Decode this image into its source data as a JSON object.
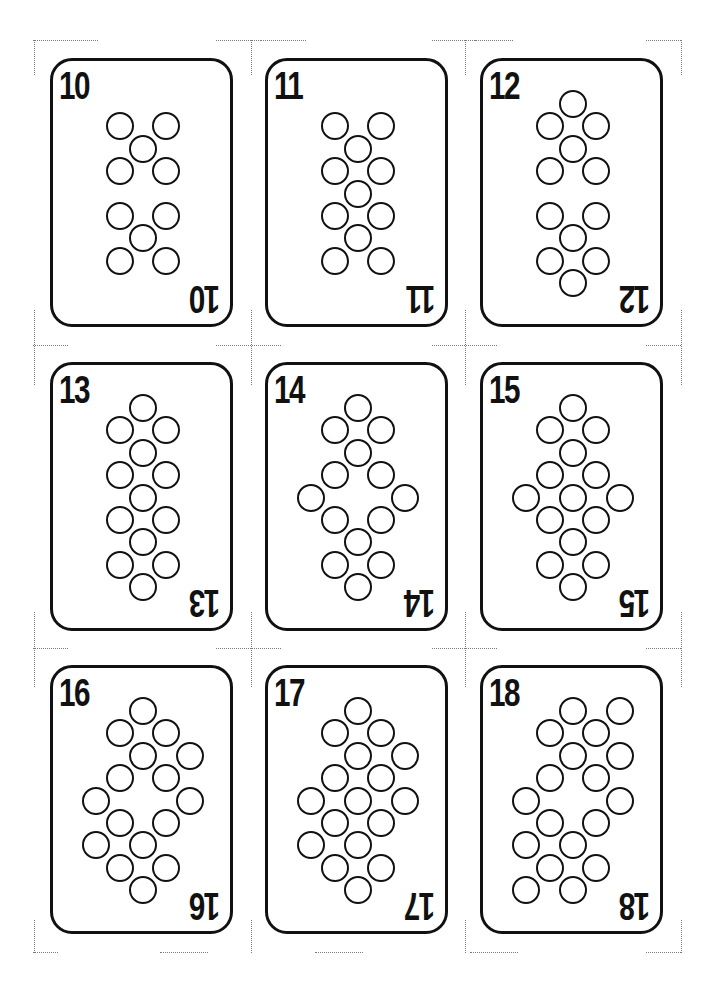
{
  "sheet": {
    "title": "Number cards 10-18 print sheet",
    "card_size": {
      "w": 183,
      "h": 269
    },
    "lattice": {
      "center_x": 93,
      "col_step": 23.3,
      "top_y": 46,
      "row_step": 22.4,
      "pip_diameter": 28
    },
    "colors": {
      "ink": "#111111",
      "paper": "#ffffff",
      "crop_marks": "#7a7a7a"
    }
  },
  "cards": [
    {
      "rank": "10",
      "x": 50,
      "y": 58,
      "pips": [
        [
          -1,
          1
        ],
        [
          1,
          1
        ],
        [
          0,
          2
        ],
        [
          -1,
          3
        ],
        [
          1,
          3
        ],
        [
          -1,
          5
        ],
        [
          1,
          5
        ],
        [
          0,
          6
        ],
        [
          -1,
          7
        ],
        [
          1,
          7
        ]
      ]
    },
    {
      "rank": "11",
      "x": 265,
      "y": 58,
      "pips": [
        [
          -1,
          1
        ],
        [
          1,
          1
        ],
        [
          0,
          2
        ],
        [
          -1,
          3
        ],
        [
          1,
          3
        ],
        [
          0,
          4
        ],
        [
          -1,
          5
        ],
        [
          1,
          5
        ],
        [
          0,
          6
        ],
        [
          -1,
          7
        ],
        [
          1,
          7
        ]
      ]
    },
    {
      "rank": "12",
      "x": 480,
      "y": 58,
      "pips": [
        [
          0,
          0
        ],
        [
          -1,
          1
        ],
        [
          1,
          1
        ],
        [
          0,
          2
        ],
        [
          -1,
          3
        ],
        [
          1,
          3
        ],
        [
          -1,
          5
        ],
        [
          1,
          5
        ],
        [
          0,
          6
        ],
        [
          -1,
          7
        ],
        [
          1,
          7
        ],
        [
          0,
          8
        ]
      ]
    },
    {
      "rank": "13",
      "x": 50,
      "y": 362,
      "pips": [
        [
          0,
          0
        ],
        [
          -1,
          1
        ],
        [
          1,
          1
        ],
        [
          0,
          2
        ],
        [
          -1,
          3
        ],
        [
          1,
          3
        ],
        [
          0,
          4
        ],
        [
          -1,
          5
        ],
        [
          1,
          5
        ],
        [
          0,
          6
        ],
        [
          -1,
          7
        ],
        [
          1,
          7
        ],
        [
          0,
          8
        ]
      ]
    },
    {
      "rank": "14",
      "x": 265,
      "y": 362,
      "pips": [
        [
          0,
          0
        ],
        [
          -1,
          1
        ],
        [
          1,
          1
        ],
        [
          0,
          2
        ],
        [
          -1,
          3
        ],
        [
          1,
          3
        ],
        [
          -2,
          4
        ],
        [
          2,
          4
        ],
        [
          -1,
          5
        ],
        [
          1,
          5
        ],
        [
          0,
          6
        ],
        [
          -1,
          7
        ],
        [
          1,
          7
        ],
        [
          0,
          8
        ]
      ]
    },
    {
      "rank": "15",
      "x": 480,
      "y": 362,
      "pips": [
        [
          0,
          0
        ],
        [
          -1,
          1
        ],
        [
          1,
          1
        ],
        [
          0,
          2
        ],
        [
          -1,
          3
        ],
        [
          1,
          3
        ],
        [
          -2,
          4
        ],
        [
          0,
          4
        ],
        [
          2,
          4
        ],
        [
          -1,
          5
        ],
        [
          1,
          5
        ],
        [
          0,
          6
        ],
        [
          -1,
          7
        ],
        [
          1,
          7
        ],
        [
          0,
          8
        ]
      ]
    },
    {
      "rank": "16",
      "x": 50,
      "y": 665,
      "pips": [
        [
          0,
          0
        ],
        [
          -1,
          1
        ],
        [
          1,
          1
        ],
        [
          0,
          2
        ],
        [
          2,
          2
        ],
        [
          -1,
          3
        ],
        [
          1,
          3
        ],
        [
          -2,
          4
        ],
        [
          2,
          4
        ],
        [
          -1,
          5
        ],
        [
          1,
          5
        ],
        [
          -2,
          6
        ],
        [
          0,
          6
        ],
        [
          -1,
          7
        ],
        [
          1,
          7
        ],
        [
          0,
          8
        ]
      ]
    },
    {
      "rank": "17",
      "x": 265,
      "y": 665,
      "pips": [
        [
          0,
          0
        ],
        [
          -1,
          1
        ],
        [
          1,
          1
        ],
        [
          0,
          2
        ],
        [
          2,
          2
        ],
        [
          -1,
          3
        ],
        [
          1,
          3
        ],
        [
          -2,
          4
        ],
        [
          0,
          4
        ],
        [
          2,
          4
        ],
        [
          -1,
          5
        ],
        [
          1,
          5
        ],
        [
          -2,
          6
        ],
        [
          0,
          6
        ],
        [
          -1,
          7
        ],
        [
          1,
          7
        ],
        [
          0,
          8
        ]
      ]
    },
    {
      "rank": "18",
      "x": 480,
      "y": 665,
      "pips": [
        [
          0,
          0
        ],
        [
          2,
          0
        ],
        [
          -1,
          1
        ],
        [
          1,
          1
        ],
        [
          0,
          2
        ],
        [
          2,
          2
        ],
        [
          -1,
          3
        ],
        [
          1,
          3
        ],
        [
          -2,
          4
        ],
        [
          2,
          4
        ],
        [
          -1,
          5
        ],
        [
          1,
          5
        ],
        [
          -2,
          6
        ],
        [
          0,
          6
        ],
        [
          -1,
          7
        ],
        [
          1,
          7
        ],
        [
          -2,
          8
        ],
        [
          0,
          8
        ]
      ]
    }
  ],
  "crop_marks": {
    "h": [
      [
        33,
        40,
        65
      ],
      [
        216,
        40,
        45
      ],
      [
        261,
        40,
        45
      ],
      [
        432,
        40,
        45
      ],
      [
        475,
        40,
        38
      ],
      [
        646,
        40,
        35
      ],
      [
        33,
        345,
        35
      ],
      [
        216,
        345,
        65
      ],
      [
        432,
        345,
        65
      ],
      [
        646,
        345,
        35
      ],
      [
        33,
        648,
        35
      ],
      [
        216,
        648,
        65
      ],
      [
        432,
        648,
        65
      ],
      [
        646,
        648,
        35
      ],
      [
        33,
        952,
        25
      ],
      [
        160,
        952,
        48
      ],
      [
        315,
        952,
        48
      ],
      [
        470,
        952,
        48
      ],
      [
        646,
        952,
        35
      ]
    ],
    "v": [
      [
        34,
        40,
        35
      ],
      [
        251,
        40,
        35
      ],
      [
        465,
        40,
        35
      ],
      [
        681,
        40,
        35
      ],
      [
        34,
        310,
        75
      ],
      [
        251,
        310,
        75
      ],
      [
        465,
        310,
        75
      ],
      [
        681,
        310,
        75
      ],
      [
        34,
        612,
        75
      ],
      [
        251,
        612,
        75
      ],
      [
        465,
        612,
        75
      ],
      [
        681,
        612,
        75
      ],
      [
        34,
        920,
        33
      ],
      [
        251,
        920,
        33
      ],
      [
        465,
        920,
        33
      ],
      [
        681,
        920,
        33
      ]
    ]
  }
}
